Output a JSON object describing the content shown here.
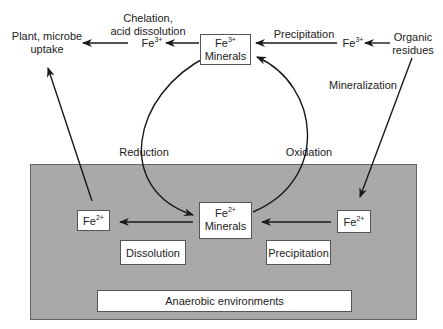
{
  "diagram": {
    "regions": {
      "anaerobic": "Anaerobic environments"
    },
    "nodes": {
      "plant_uptake": [
        "Plant, microbe",
        "uptake"
      ],
      "fe3_chelation_caption": [
        "Chelation,",
        "acid dissolution"
      ],
      "fe3_left": {
        "base": "Fe",
        "sup": "3+"
      },
      "fe3_minerals": {
        "base": "Fe",
        "sup": "3+",
        "line2": "Minerals"
      },
      "fe3_right": {
        "base": "Fe",
        "sup": "3+"
      },
      "organic_residues": [
        "Organic",
        "residues"
      ],
      "fe2_left": {
        "base": "Fe",
        "sup": "2+"
      },
      "fe2_minerals": {
        "base": "Fe",
        "sup": "2+",
        "line2": "Minerals"
      },
      "fe2_right": {
        "base": "Fe",
        "sup": "2+"
      }
    },
    "edge_labels": {
      "precipitation_top": "Precipitation",
      "mineralization": "Mineralization",
      "reduction": "Reduction",
      "oxidation": "Oxidation",
      "dissolution": "Dissolution",
      "precipitation_bottom": "Precipitation"
    },
    "colors": {
      "anaerobic_fill": "#a9a9a9",
      "line": "#1a1a1a",
      "box_fill": "#ffffff"
    }
  }
}
